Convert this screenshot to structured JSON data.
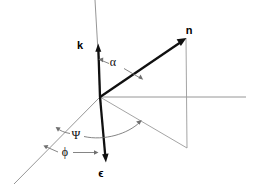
{
  "figure": {
    "type": "vector-angle-diagram",
    "background_color": "#ffffff",
    "width": 254,
    "height": 188
  },
  "colors": {
    "background": "#ffffff",
    "vector_stroke": "#101010",
    "axis_stroke": "#8a8a8a",
    "projection_stroke": "#9a9a9a",
    "arc_stroke": "#6f6f6f",
    "label_fill": "#000000"
  },
  "vectors": [
    {
      "id": "k",
      "label": "k",
      "style": "bold",
      "label_x": 80,
      "label_y": 49,
      "from": [
        100,
        97
      ],
      "to": [
        98,
        46
      ]
    },
    {
      "id": "n",
      "label": "n",
      "style": "bold",
      "label_x": 189,
      "label_y": 34,
      "from": [
        100,
        97
      ],
      "to": [
        186,
        38
      ]
    },
    {
      "id": "epsilon",
      "label": "ϵ",
      "style": "bold",
      "label_x": 101,
      "label_y": 177,
      "from": [
        100,
        97
      ],
      "to": [
        106,
        160
      ]
    }
  ],
  "angles": [
    {
      "id": "alpha",
      "label": "α",
      "label_x": 113,
      "label_y": 66,
      "between": [
        "k",
        "n"
      ]
    },
    {
      "id": "psi",
      "label": "Ψ",
      "label_x": 73,
      "label_y": 138,
      "between": [
        "diagonal-axis",
        "projection-of-n"
      ]
    },
    {
      "id": "phi",
      "label": "ϕ",
      "label_x": 63,
      "label_y": 155,
      "between": [
        "diagonal-axis",
        "epsilon"
      ]
    }
  ],
  "axes": [
    {
      "id": "vertical-axis",
      "from": [
        95,
        0
      ],
      "to": [
        101,
        104
      ]
    },
    {
      "id": "horizontal-axis",
      "from": [
        100,
        97
      ],
      "to": [
        246,
        97
      ]
    },
    {
      "id": "diagonal-axis",
      "from": [
        100,
        97
      ],
      "to": [
        14,
        184
      ]
    }
  ],
  "projections": [
    {
      "id": "n-drop-line",
      "from": [
        186,
        38
      ],
      "to": [
        187,
        148
      ]
    },
    {
      "id": "n-ground-projection",
      "from": [
        100,
        97
      ],
      "to": [
        187,
        148
      ]
    }
  ]
}
